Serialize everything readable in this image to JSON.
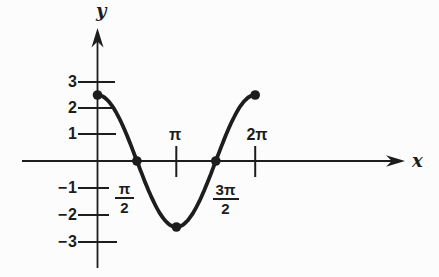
{
  "figure": {
    "y_axis_label": "y",
    "x_axis_label": "x",
    "y_ticks_positive": [
      "3",
      "2",
      "1"
    ],
    "y_ticks_negative": [
      "−1",
      "−2",
      "−3"
    ],
    "x_tick_pi": "π",
    "x_tick_2pi": "2π",
    "frac_pi_2": {
      "num": "π",
      "den": "2"
    },
    "frac_3pi_2": {
      "num": "3π",
      "den": "2"
    }
  },
  "colors": {
    "ink": "#1d1d1d",
    "background": "#fcfcfc"
  },
  "chart_data": {
    "type": "line",
    "title": "",
    "xlabel": "x",
    "ylabel": "y",
    "grid": false,
    "x_domain_radians": [
      0,
      6.2832
    ],
    "ylim": [
      -3.6,
      3.6
    ],
    "x_tick_labels": [
      "π/2",
      "π",
      "3π/2",
      "2π"
    ],
    "x_tick_values_radians": [
      1.5708,
      3.1416,
      4.7124,
      6.2832
    ],
    "y_tick_values": [
      3,
      2,
      1,
      -1,
      -2,
      -3
    ],
    "amplitude": 2.5,
    "function_estimate": "y = 2.5 cos x, 0 ≤ x ≤ 2π",
    "marked_points": [
      {
        "x": 0,
        "y": 2.5
      },
      {
        "x": 1.5708,
        "y": 0
      },
      {
        "x": 3.1416,
        "y": -2.5
      },
      {
        "x": 4.7124,
        "y": 0
      },
      {
        "x": 6.2832,
        "y": 2.5
      }
    ]
  }
}
